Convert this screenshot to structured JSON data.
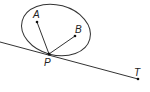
{
  "diagram": {
    "stroke_color": "#333333",
    "points": {
      "A": {
        "label": "A",
        "x": 37,
        "y": 22
      },
      "B": {
        "label": "B",
        "x": 75,
        "y": 36
      },
      "P": {
        "label": "P",
        "x": 49,
        "y": 54
      },
      "T": {
        "label": "T",
        "x": 138,
        "y": 79
      }
    },
    "ellipse": {
      "cx": 56,
      "cy": 30,
      "rx": 35,
      "ry": 25,
      "rotation": 15
    },
    "tangent_line": {
      "x1": 0,
      "y1": 42,
      "x2": 138,
      "y2": 79
    },
    "segments": [
      {
        "from": "P",
        "to": "A"
      },
      {
        "from": "P",
        "to": "B"
      }
    ]
  }
}
